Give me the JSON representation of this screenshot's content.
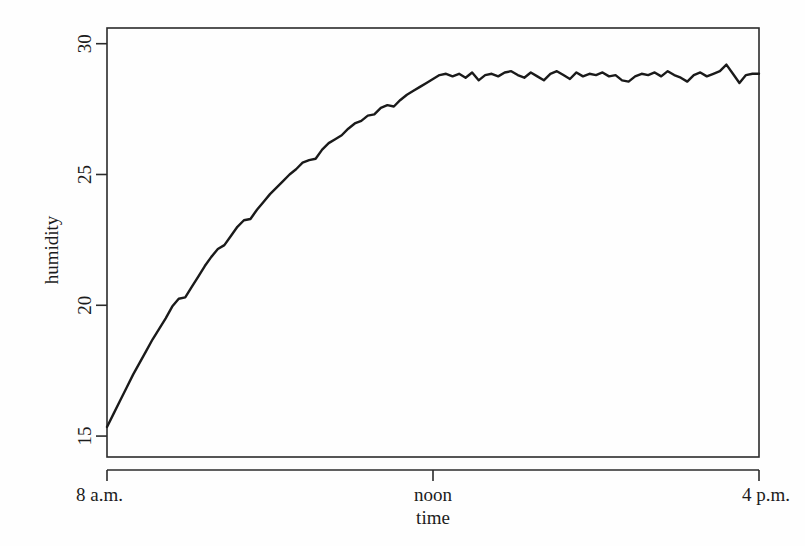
{
  "figure": {
    "background_color": "#fefefe",
    "line_color": "#1a1a1a",
    "axis_color": "#2b2b2b"
  },
  "chart_data": {
    "type": "line",
    "title": "",
    "subtitle": "",
    "xlabel": "time",
    "ylabel": "humidity",
    "grid": false,
    "legend": null,
    "xlim": [
      8,
      16
    ],
    "ylim": [
      14.2,
      30.6
    ],
    "x_tick_values": [
      8,
      12,
      16
    ],
    "x_tick_labels": [
      "8 a.m.",
      "noon",
      "4 p.m."
    ],
    "y_tick_values": [
      15,
      20,
      25,
      30
    ],
    "y_tick_labels": [
      "15",
      "20",
      "25",
      "30"
    ],
    "series": [
      {
        "name": "humidity",
        "x": [
          8.0,
          8.08,
          8.16,
          8.24,
          8.32,
          8.4,
          8.48,
          8.56,
          8.64,
          8.72,
          8.8,
          8.88,
          8.96,
          9.04,
          9.12,
          9.2,
          9.28,
          9.36,
          9.44,
          9.52,
          9.6,
          9.68,
          9.76,
          9.84,
          9.92,
          10.0,
          10.08,
          10.16,
          10.24,
          10.32,
          10.4,
          10.48,
          10.56,
          10.64,
          10.72,
          10.8,
          10.88,
          10.96,
          11.04,
          11.12,
          11.2,
          11.28,
          11.36,
          11.44,
          11.52,
          11.6,
          11.68,
          11.76,
          11.84,
          11.92,
          12.0,
          12.08,
          12.16,
          12.24,
          12.32,
          12.4,
          12.48,
          12.56,
          12.64,
          12.72,
          12.8,
          12.88,
          12.96,
          13.04,
          13.12,
          13.2,
          13.28,
          13.36,
          13.44,
          13.52,
          13.6,
          13.68,
          13.76,
          13.84,
          13.92,
          14.0,
          14.08,
          14.16,
          14.24,
          14.32,
          14.4,
          14.48,
          14.56,
          14.64,
          14.72,
          14.8,
          14.88,
          14.96,
          15.04,
          15.12,
          15.2,
          15.28,
          15.36,
          15.44,
          15.52,
          15.6,
          15.68,
          15.76,
          15.84,
          15.92,
          16.0
        ],
        "y": [
          15.35,
          15.85,
          16.35,
          16.85,
          17.35,
          17.8,
          18.25,
          18.7,
          19.1,
          19.5,
          19.95,
          20.25,
          20.3,
          20.7,
          21.1,
          21.5,
          21.85,
          22.15,
          22.3,
          22.65,
          23.0,
          23.25,
          23.3,
          23.65,
          23.95,
          24.25,
          24.5,
          24.75,
          25.0,
          25.2,
          25.45,
          25.55,
          25.6,
          25.95,
          26.2,
          26.35,
          26.5,
          26.75,
          26.95,
          27.05,
          27.25,
          27.3,
          27.55,
          27.65,
          27.6,
          27.85,
          28.05,
          28.2,
          28.35,
          28.5,
          28.65,
          28.8,
          28.85,
          28.75,
          28.85,
          28.7,
          28.9,
          28.6,
          28.8,
          28.85,
          28.75,
          28.9,
          28.95,
          28.8,
          28.7,
          28.9,
          28.75,
          28.6,
          28.85,
          28.95,
          28.8,
          28.65,
          28.9,
          28.75,
          28.85,
          28.8,
          28.9,
          28.75,
          28.8,
          28.6,
          28.55,
          28.75,
          28.85,
          28.8,
          28.9,
          28.75,
          28.95,
          28.8,
          28.7,
          28.55,
          28.8,
          28.9,
          28.75,
          28.85,
          28.95,
          29.2,
          28.85,
          28.5,
          28.8,
          28.85,
          28.85
        ]
      }
    ]
  }
}
